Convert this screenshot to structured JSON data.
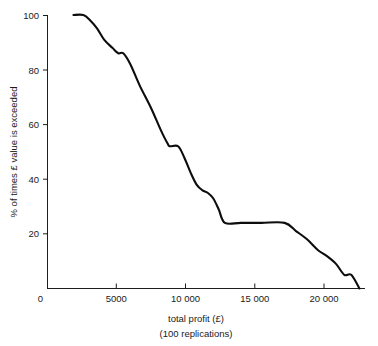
{
  "chart_data": {
    "type": "line",
    "title": "",
    "xlabel": "total profit (£)",
    "xlabel_sub": "(100 replications)",
    "ylabel": "% of times £ value is exceeded",
    "xlim": [
      0,
      23000
    ],
    "ylim": [
      0,
      100
    ],
    "grid": false,
    "legend": "none",
    "xticks": [
      0,
      5000,
      10000,
      15000,
      20000
    ],
    "xtick_labels": [
      "0",
      "5000",
      "10 000",
      "15 000",
      "20 000"
    ],
    "yticks": [
      0,
      20,
      40,
      60,
      80,
      100
    ],
    "ytick_labels": [
      "0",
      "20",
      "40",
      "60",
      "80",
      "100"
    ],
    "series": [
      {
        "name": "% of times £ value is exceeded",
        "color": "#0d0d0d",
        "x": [
          1880,
          2600,
          3100,
          3600,
          4100,
          4700,
          5130,
          5490,
          6000,
          6700,
          7500,
          8200,
          8700,
          8880,
          9460,
          9900,
          10400,
          10800,
          11200,
          11600,
          12000,
          12400,
          12850,
          14000,
          15500,
          17180,
          18000,
          18800,
          19600,
          20200,
          20900,
          21500,
          22000,
          22600
        ],
        "y": [
          100,
          100,
          98,
          95,
          91,
          88,
          86,
          86,
          82,
          74,
          66,
          58,
          53,
          52,
          52,
          48,
          42,
          38,
          36,
          35,
          33,
          29,
          24,
          24,
          24,
          24,
          21,
          18,
          14,
          12,
          9,
          5,
          5,
          0
        ]
      }
    ]
  },
  "axis": {
    "y_axis_name": "percentage-axis",
    "x_axis_name": "profit-axis"
  }
}
